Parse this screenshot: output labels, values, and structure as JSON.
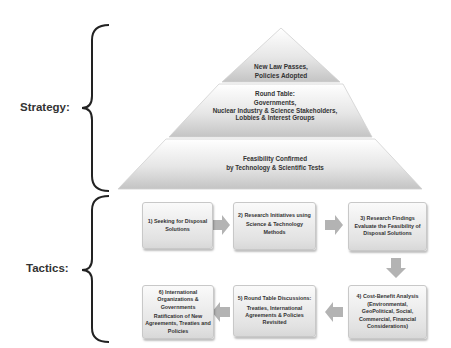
{
  "labels": {
    "strategy": "Strategy:",
    "tactics": "Tactics:"
  },
  "pyramid": {
    "top": {
      "line1": "New Law Passes,",
      "line2": "Policies Adopted"
    },
    "middle": {
      "line1": "Round Table:",
      "line2": "Governments,",
      "line3": "Nuclear Industry & Science Stakeholders,",
      "line4": "Lobbies & Interest Groups"
    },
    "bottom": {
      "line1": "Feasibility Confirmed",
      "line2": "by Technology & Scientific Tests"
    }
  },
  "steps": [
    {
      "title": "1) Seeking for Disposal",
      "title2": "Solutions",
      "body": ""
    },
    {
      "title": "2) Research Initiatives using",
      "title2": "",
      "body": "Science & Technology",
      "body2": "Methods"
    },
    {
      "title": "3) Research Findings",
      "title2": "Evaluate the Feasibility of",
      "title3": "Disposal Solutions"
    },
    {
      "title": "4) Cost-Benefit Analysis",
      "title2": "(Environmental,",
      "title3": "GeoPolitical, Social,",
      "title4": "Commercial, Financial",
      "title5": "Considerations)"
    },
    {
      "title": "5) Round Table Discussions:",
      "body": "Treaties, International",
      "body2": "Agreements & Policies",
      "body3": "Revisited"
    },
    {
      "title": "6) International",
      "title2": "Organizations &",
      "title3": "Governments",
      "body": "Ratification of New",
      "body2": "Agreements, Treaties and",
      "body3": "Policies"
    }
  ],
  "colors": {
    "pyramid_light": "#f4f4f4",
    "pyramid_dark": "#c9c9c9",
    "arrow": "#b3b3b3",
    "brace": "#222222"
  }
}
